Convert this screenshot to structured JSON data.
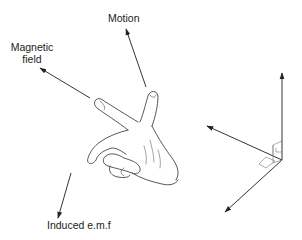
{
  "labels": {
    "motion": "Motion",
    "magnetic_field_line1": "Magnetic",
    "magnetic_field_line2": "field",
    "induced_emf": "Induced e.m.f"
  },
  "colors": {
    "line": "#333333",
    "hand_outline": "#444444",
    "background": "#ffffff"
  }
}
